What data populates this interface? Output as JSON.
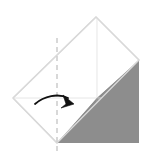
{
  "figure": {
    "title": "Origami fold step diagram",
    "description": "Square sheet rotated 45 degrees with the lower-right quadrant shaded gray, a vertical dashed fold line through the center, and a curved arrow pointing right indicating the fold direction.",
    "background_color": "#ffffff"
  },
  "colors": {
    "background": "#ffffff",
    "paper_front": "#ffffff",
    "paper_shaded": "#8d8d8d",
    "outline": "#d9d9d9",
    "crease_line": "#e2e2e2",
    "crease_line_on_shade": "#9e9e9e",
    "dashed_fold_line": "#cfcfcf",
    "arrow": "#111111"
  },
  "geometry": {
    "canvas_width": 148,
    "canvas_height": 159,
    "vertices": {
      "left": [
        13,
        98
      ],
      "top": [
        96,
        17
      ],
      "right": [
        139,
        60
      ],
      "bottom": [
        57,
        143
      ],
      "center": [
        76,
        80
      ]
    },
    "shaded_triangle": [
      [
        57,
        143
      ],
      [
        97,
        98
      ],
      [
        139,
        60
      ],
      [
        139,
        143
      ]
    ],
    "dashed_fold_x": 57,
    "dashed_fold_y_start": 38,
    "dashed_fold_y_end": 152
  },
  "elements": {
    "outline_name": "paper-outline",
    "shaded_name": "shaded-flap",
    "dashed_name": "fold-line-dashed",
    "arrow_name": "fold-direction-arrow",
    "horizontal_crease_name": "horizontal-crease",
    "vertical_crease_name": "vertical-crease",
    "diagonal_crease_name": "diagonal-crease"
  },
  "labels": {
    "step_label": "",
    "note": ""
  }
}
